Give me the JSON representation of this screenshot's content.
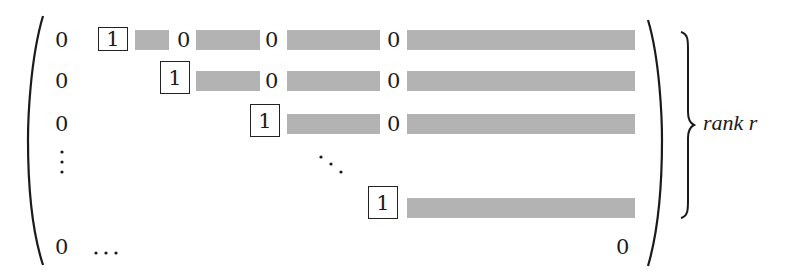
{
  "matrix": {
    "zero": "0",
    "one": "1",
    "hdots": "…",
    "vdots": "⋮",
    "ddots": "⋱",
    "bar_color": "#b3b3b3",
    "rows": [
      {
        "first": "0",
        "pivot": "1",
        "zeros_after": [
          "0",
          "0",
          "0"
        ]
      },
      {
        "first": "0",
        "pivot": "1",
        "zeros_after": [
          "0",
          "0"
        ]
      },
      {
        "first": "0",
        "pivot": "1",
        "zeros_after": [
          "0"
        ]
      },
      {
        "first": "⋮",
        "pivot": "⋱"
      },
      {
        "pivot": "1"
      },
      {
        "first": "0",
        "middle": "…",
        "last": "0"
      }
    ]
  },
  "annotation": {
    "label": "rank r"
  }
}
